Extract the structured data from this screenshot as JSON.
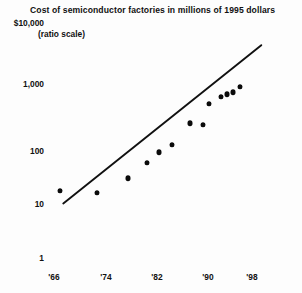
{
  "chart_data": {
    "type": "scatter",
    "title": "Cost of semiconductor factories in millions of 1995 dollars",
    "subtitle": "(ratio scale)",
    "xlabel": "",
    "ylabel": "",
    "scale": "log",
    "grid": false,
    "legend": null,
    "yticklabels": [
      "$10,000",
      "1,000",
      "100",
      "10",
      "1"
    ],
    "ytickvalues": [
      10000,
      1000,
      100,
      10,
      1
    ],
    "ylim": [
      1,
      10000
    ],
    "xticklabels": [
      "'66",
      "'74",
      "'82",
      "'90",
      "'98"
    ],
    "xtickvalues": [
      1966,
      1974,
      1982,
      1990,
      1998
    ],
    "xlim": [
      1964,
      2000
    ],
    "x": [
      1967,
      1973,
      1978,
      1981,
      1983,
      1985,
      1988,
      1990,
      1991,
      1993,
      1994,
      1995,
      1996
    ],
    "values": [
      14,
      13,
      23,
      42,
      63,
      85,
      195,
      185,
      420,
      560,
      620,
      660,
      820
    ],
    "points": [
      {
        "x": 1967,
        "y": 14
      },
      {
        "x": 1973,
        "y": 13
      },
      {
        "x": 1978,
        "y": 23
      },
      {
        "x": 1981,
        "y": 42
      },
      {
        "x": 1983,
        "y": 63
      },
      {
        "x": 1985,
        "y": 85
      },
      {
        "x": 1988,
        "y": 195
      },
      {
        "x": 1990,
        "y": 185
      },
      {
        "x": 1991,
        "y": 420
      },
      {
        "x": 1993,
        "y": 560
      },
      {
        "x": 1994,
        "y": 620
      },
      {
        "x": 1995,
        "y": 660
      },
      {
        "x": 1996,
        "y": 820
      }
    ],
    "trendline": {
      "type": "log-linear-fit",
      "x_start": 1967.5,
      "y_start": 8.5,
      "x_end": 1999.5,
      "y_end": 4200
    },
    "marker_color": "#0b0b0b",
    "line_color": "#111111",
    "background_color": "#fdfdfd"
  }
}
